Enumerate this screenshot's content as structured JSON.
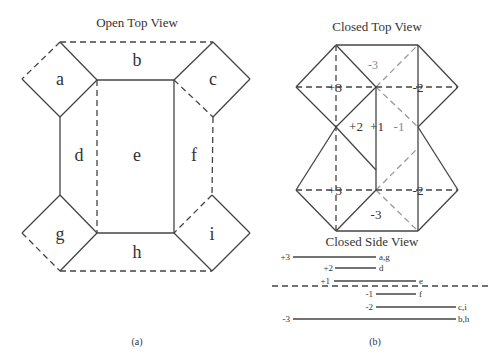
{
  "panel_a": {
    "title": "Open Top View",
    "caption": "(a)",
    "labels": {
      "a": "a",
      "b": "b",
      "c": "c",
      "d": "d",
      "e": "e",
      "f": "f",
      "g": "g",
      "h": "h",
      "i": "i"
    }
  },
  "panel_b": {
    "title": "Closed Top View",
    "caption": "(b)",
    "top_labels": {
      "m3_top": "-3",
      "p3_top": "+3",
      "m2_top": "-2",
      "p2": "+2",
      "p1": "+1",
      "m1": "-1",
      "p3_bot": "+3",
      "m2_bot": "-2",
      "m3_bot": "-3"
    },
    "side_view": {
      "title": "Closed Side View",
      "levels": [
        {
          "level": "+3",
          "faces": "a,g"
        },
        {
          "level": "+2",
          "faces": "d"
        },
        {
          "level": "+1",
          "faces": "e"
        },
        {
          "level": "-1",
          "faces": "f"
        },
        {
          "level": "-2",
          "faces": "c,i"
        },
        {
          "level": "-3",
          "faces": "b,h"
        }
      ]
    }
  }
}
